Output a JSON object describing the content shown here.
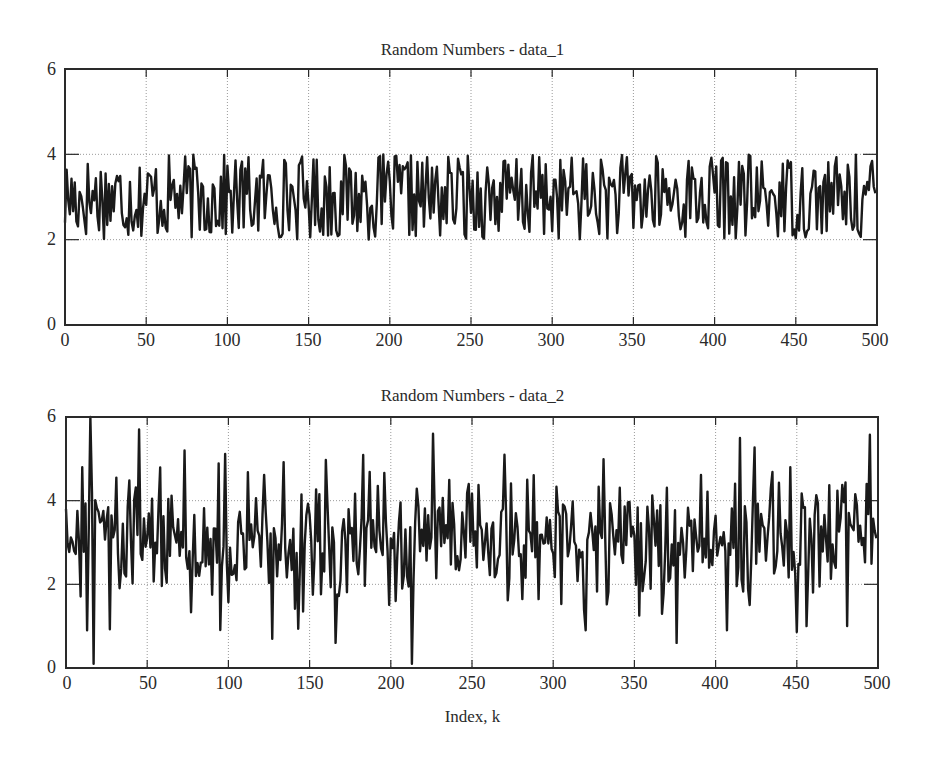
{
  "chart_data": [
    {
      "type": "line",
      "title": "Random Numbers - data_1",
      "xlabel": "",
      "ylabel": "",
      "xlim": [
        0,
        500
      ],
      "ylim": [
        0,
        6
      ],
      "xticks": [
        0,
        50,
        100,
        150,
        200,
        250,
        300,
        350,
        400,
        450,
        500
      ],
      "yticks": [
        0,
        2,
        4,
        6
      ],
      "grid": true,
      "series": [
        {
          "name": "data_1",
          "generator": "uniform",
          "range": [
            2,
            4
          ],
          "n": 500,
          "seed": 17,
          "start_value": 2.4
        }
      ]
    },
    {
      "type": "line",
      "title": "Random Numbers - data_2",
      "xlabel": "Index, k",
      "ylabel": "",
      "xlim": [
        0,
        500
      ],
      "ylim": [
        0,
        6
      ],
      "xticks": [
        0,
        50,
        100,
        150,
        200,
        250,
        300,
        350,
        400,
        450,
        500
      ],
      "yticks": [
        0,
        2,
        4,
        6
      ],
      "grid": true,
      "series": [
        {
          "name": "data_2",
          "generator": "normal",
          "mean": 3,
          "std": 0.8,
          "n": 500,
          "seed": 29,
          "start_value": 3.8,
          "notable_points": [
            {
              "k": 10,
              "y": 4.8
            },
            {
              "k": 15,
              "y": 6.0
            },
            {
              "k": 17,
              "y": 0.1
            },
            {
              "k": 13,
              "y": 0.9
            },
            {
              "k": 45,
              "y": 5.7
            },
            {
              "k": 73,
              "y": 5.2
            },
            {
              "k": 127,
              "y": 0.7
            },
            {
              "k": 166,
              "y": 0.6
            },
            {
              "k": 213,
              "y": 0.1
            },
            {
              "k": 226,
              "y": 5.6
            },
            {
              "k": 320,
              "y": 0.9
            },
            {
              "k": 376,
              "y": 0.6
            },
            {
              "k": 415,
              "y": 5.5
            },
            {
              "k": 407,
              "y": 0.9
            },
            {
              "k": 446,
              "y": 4.8
            },
            {
              "k": 456,
              "y": 1.0
            },
            {
              "k": 493,
              "y": 4.4
            }
          ]
        }
      ]
    }
  ],
  "plots": [
    {
      "title": "Random Numbers - data_1"
    },
    {
      "title": "Random Numbers - data_2"
    }
  ],
  "axis": {
    "xtick_labels": [
      "0",
      "50",
      "100",
      "150",
      "200",
      "250",
      "300",
      "350",
      "400",
      "450",
      "500"
    ],
    "ytick_labels": [
      "0",
      "2",
      "4",
      "6"
    ],
    "xlabel": "Index, k"
  },
  "colors": {
    "line": "#1a1a1a",
    "axes": "#2a2a2a",
    "grid": "#9a9a9a",
    "background": "#ffffff"
  }
}
